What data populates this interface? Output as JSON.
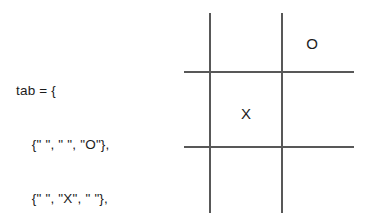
{
  "code": {
    "language_hint": "lua-table",
    "variable_name": "tab",
    "lines": [
      "tab = {",
      "    {\" \", \" \", \"O\"},",
      "    {\" \", \"X\", \" \"},",
      "    {\" \", \" \", \" \"}",
      "}"
    ],
    "line_1": "tab = {",
    "line_2": "    {\" \", \" \", \"O\"},",
    "line_3": "    {\" \", \"X\", \" \"},",
    "line_4": "    {\" \", \" \", \" \"}",
    "line_5": "}"
  },
  "board": {
    "title": "tic-tac-toe-grid",
    "rows": 3,
    "columns": 3,
    "line_color": "#585858",
    "text_color": "#1c1c1c",
    "background": "#ffffff",
    "cells": [
      [
        " ",
        " ",
        "O"
      ],
      [
        " ",
        "X",
        " "
      ],
      [
        " ",
        " ",
        " "
      ]
    ],
    "marks": {
      "top_right": "O",
      "center": "X"
    }
  }
}
